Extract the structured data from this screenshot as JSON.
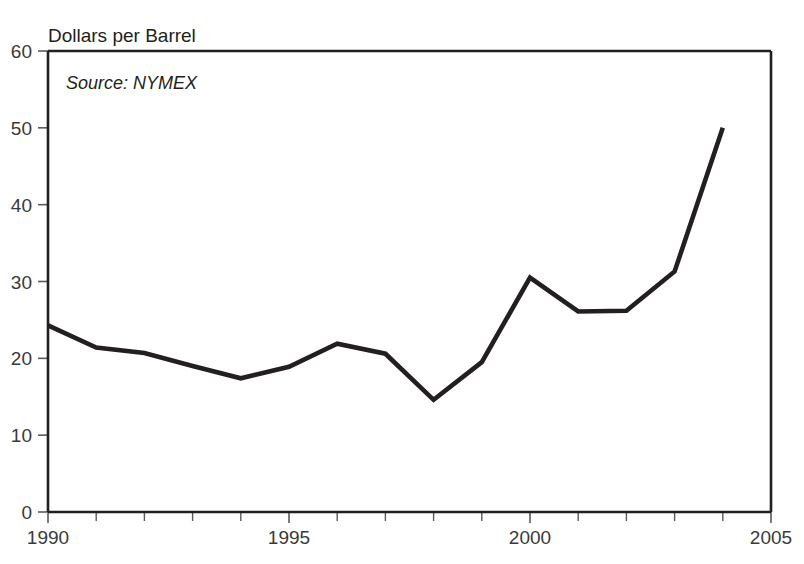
{
  "chart_data": {
    "type": "line",
    "title": "",
    "subtitle": "",
    "ylabel": "Dollars per Barrel",
    "xlabel": "",
    "annotation": "Source: NYMEX",
    "grid": false,
    "legend": "none",
    "xlim": [
      1990,
      2005
    ],
    "ylim": [
      0,
      60
    ],
    "x_tick_labels": [
      "1990",
      "1995",
      "2000",
      "2005"
    ],
    "x_tick_values": [
      1990,
      1995,
      2000,
      2005
    ],
    "x_minor_tick_values": [
      1991,
      1992,
      1993,
      1994,
      1996,
      1997,
      1998,
      1999,
      2001,
      2002,
      2003,
      2004
    ],
    "y_tick_labels": [
      "0",
      "10",
      "20",
      "30",
      "40",
      "50",
      "60"
    ],
    "y_tick_values": [
      0,
      10,
      20,
      30,
      40,
      50,
      60
    ],
    "series": [
      {
        "name": "Crude Oil Price",
        "color": "#231f20",
        "line_width": 4.6,
        "x": [
          1990,
          1991,
          1992,
          1993,
          1994,
          1995,
          1996,
          1997,
          1998,
          1999,
          2000,
          2001,
          2002,
          2003,
          2004
        ],
        "values": [
          24.3,
          21.4,
          20.7,
          19.0,
          17.4,
          18.9,
          21.9,
          20.6,
          14.6,
          19.5,
          30.5,
          26.1,
          26.2,
          31.3,
          50.0
        ]
      }
    ]
  },
  "figure": {
    "background_color": "#ffffff",
    "axis_color": "#231f20",
    "tick_color": "#5a5a5a",
    "text_color": "#231f20"
  }
}
